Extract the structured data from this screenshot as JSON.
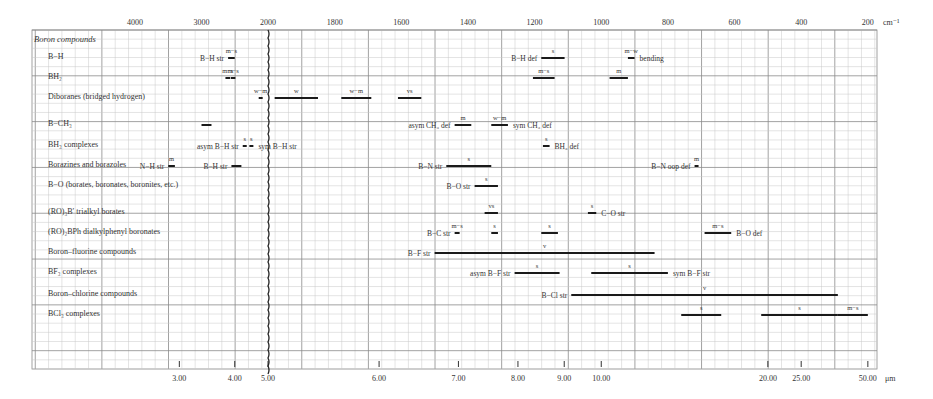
{
  "chart_data": {
    "type": "range-bar",
    "title": "Boron compounds",
    "top_axis": {
      "unit": "cm-1",
      "ticks": [
        4000,
        3000,
        2000,
        1800,
        1600,
        1400,
        1200,
        1000,
        800,
        600,
        400,
        200
      ],
      "tick_labels": [
        "4000",
        "3000",
        "2000",
        "1800",
        "1600",
        "1400",
        "1200",
        "1000",
        "800",
        "600",
        "400",
        "200"
      ],
      "scale_note": "1000 cm-1 per major division above 2000; 200 cm-1 per major division below 2000 (axis break at 2000)"
    },
    "bottom_axis": {
      "unit": "μm",
      "tick_labels": [
        "3.00",
        "4.00",
        "5.00",
        "6.00",
        "7.00",
        "8.00",
        "9.00",
        "10.00",
        "20.00",
        "25.00",
        "50.00"
      ],
      "ticks": [
        3.0,
        4.0,
        5.0,
        6.0,
        7.0,
        8.0,
        9.0,
        10.0,
        20.0,
        25.0,
        50.0
      ]
    },
    "grid": true,
    "rows": [
      {
        "name": "B−H",
        "bands": [
          {
            "label": "B−H str",
            "from": 2600,
            "to": 2500,
            "intensity": "m−s"
          },
          {
            "label": "B−H def",
            "from": 1180,
            "to": 1110,
            "intensity": "s"
          },
          {
            "label": "bending",
            "from": 920,
            "to": 900,
            "intensity": "m−w"
          }
        ]
      },
      {
        "name": "BH₂",
        "bands": [
          {
            "label": "",
            "from": 2640,
            "to": 2570,
            "intensity": "m−s"
          },
          {
            "label": "",
            "from": 2560,
            "to": 2490,
            "intensity": "m−s"
          },
          {
            "label": "",
            "from": 1205,
            "to": 1140,
            "intensity": "m−s"
          },
          {
            "label": "",
            "from": 975,
            "to": 920,
            "intensity": "m"
          }
        ]
      },
      {
        "name": "Diboranes (bridged hydrogen)",
        "bands": [
          {
            "label": "",
            "from": 2140,
            "to": 2080,
            "intensity": "w−m"
          },
          {
            "label": "",
            "from": 1980,
            "to": 1850,
            "intensity": "w"
          },
          {
            "label": "",
            "from": 1780,
            "to": 1690,
            "intensity": "w−m"
          },
          {
            "label": "",
            "from": 1610,
            "to": 1540,
            "intensity": "vs"
          }
        ]
      },
      {
        "name": "B−CH₃",
        "bands": [
          {
            "label": "",
            "from": 3000,
            "to": 2850,
            "intensity": ""
          },
          {
            "label": "asym CH₃ def",
            "from": 1440,
            "to": 1390,
            "intensity": "m"
          },
          {
            "label": "sym CH₃ def",
            "from": 1330,
            "to": 1280,
            "intensity": "w−m"
          }
        ]
      },
      {
        "name": "BH₃ complexes",
        "bands": [
          {
            "label": "asym B−H str",
            "from": 2380,
            "to": 2360,
            "intensity": "s"
          },
          {
            "label": "sym B−H str",
            "from": 2280,
            "to": 2260,
            "intensity": "s"
          },
          {
            "label": "BH₃ def",
            "from": 1175,
            "to": 1155,
            "intensity": "s"
          }
        ]
      },
      {
        "name": "Borazines and borazoles",
        "bands": [
          {
            "label": "N−H str",
            "from": 3500,
            "to": 3400,
            "intensity": "m"
          },
          {
            "label": "B−H str",
            "from": 2550,
            "to": 2400,
            "intensity": ""
          },
          {
            "label": "B−N str",
            "from": 1465,
            "to": 1330,
            "intensity": "s"
          },
          {
            "label": "B−N oop def",
            "from": 720,
            "to": 710,
            "intensity": "m"
          }
        ]
      },
      {
        "name": "B−O (borates, boronates, boronites, etc.)",
        "bands": [
          {
            "label": "B−O str",
            "from": 1380,
            "to": 1310,
            "intensity": "s"
          }
        ]
      },
      {
        "name": "(RO)₃B′ trialkyl borates",
        "bands": [
          {
            "label": "",
            "from": 1350,
            "to": 1310,
            "intensity": "vs"
          },
          {
            "label": "C−O str",
            "from": 1040,
            "to": 1015,
            "intensity": "s"
          }
        ]
      },
      {
        "name": "(RO)₂BPh dialkylphenyl boronates",
        "bands": [
          {
            "label": "B−C str",
            "from": 1440,
            "to": 1425,
            "intensity": "m−s"
          },
          {
            "label": "",
            "from": 1330,
            "to": 1310,
            "intensity": "s"
          },
          {
            "label": "",
            "from": 1180,
            "to": 1130,
            "intensity": "s"
          },
          {
            "label": "B−O def",
            "from": 690,
            "to": 610,
            "intensity": "m−s"
          }
        ]
      },
      {
        "name": "Boron–fluorine compounds",
        "bands": [
          {
            "label": "B−F str",
            "from": 1500,
            "to": 840,
            "intensity": "v"
          }
        ]
      },
      {
        "name": "BF₃ complexes",
        "bands": [
          {
            "label": "asym B−F str",
            "from": 1260,
            "to": 1125,
            "intensity": "s"
          },
          {
            "label": "sym B−F str",
            "from": 1030,
            "to": 800,
            "intensity": "s"
          }
        ]
      },
      {
        "name": "Boron–chlorine compounds",
        "bands": [
          {
            "label": "B−Cl str",
            "from": 1090,
            "to": 290,
            "intensity": "v"
          }
        ]
      },
      {
        "name": "BCl₃ complexes",
        "bands": [
          {
            "label": "",
            "from": 760,
            "to": 640,
            "intensity": "s"
          },
          {
            "label": "",
            "from": 520,
            "to": 290,
            "intensity": "s"
          },
          {
            "label": "",
            "from": 290,
            "to": 200,
            "intensity": "m−s"
          }
        ]
      }
    ]
  },
  "colors": {
    "grid_minor": "#c8c8c8",
    "grid_major": "#8a8a8a",
    "band": "#1a1a1a",
    "text": "#333333"
  }
}
